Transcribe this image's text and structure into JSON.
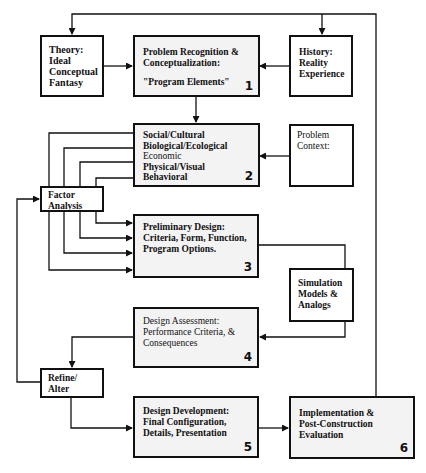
{
  "diagram": {
    "type": "flowchart",
    "nodes": {
      "theory": {
        "lines": [
          "Theory:",
          "Ideal",
          "Conceptual",
          "Fantasy"
        ]
      },
      "box1": {
        "lines": [
          "Problem Recognition &",
          "Conceptualization:"
        ],
        "sub": "\"Program Elements\"",
        "number": "1"
      },
      "history": {
        "lines": [
          "History:",
          "Reality",
          "Experience"
        ]
      },
      "box2": {
        "lines": [
          "Social/Cultural",
          "Biological/Ecological",
          "Economic",
          "Physical/Visual",
          "Behavioral"
        ],
        "number": "2"
      },
      "context": {
        "lines": [
          "Problem",
          "Context:"
        ]
      },
      "factor": {
        "lines": [
          "Factor",
          "Analysis"
        ]
      },
      "box3": {
        "lines": [
          "Preliminary Design:",
          "Criteria, Form, Function,",
          "Program Options."
        ],
        "number": "3"
      },
      "simulation": {
        "lines": [
          "Simulation",
          "Models &",
          "Analogs"
        ]
      },
      "box4": {
        "lines": [
          "Design Assessment:",
          "Performance Criteria, &",
          "Consequences"
        ],
        "number": "4"
      },
      "refine": {
        "lines": [
          "Refine/",
          "Alter"
        ]
      },
      "box5": {
        "lines": [
          "Design Development:",
          "Final Configuration,",
          "Details, Presentation"
        ],
        "number": "5"
      },
      "box6": {
        "lines": [
          "Implementation &",
          "Post-Construction",
          "Evaluation"
        ],
        "number": "6"
      }
    },
    "edges": [
      [
        "theory",
        "box1"
      ],
      [
        "history",
        "box1"
      ],
      [
        "box1",
        "box2"
      ],
      [
        "context",
        "box2"
      ],
      [
        "box2",
        "factor"
      ],
      [
        "factor",
        "box3"
      ],
      [
        "box3",
        "simulation"
      ],
      [
        "simulation",
        "box4"
      ],
      [
        "box4",
        "refine"
      ],
      [
        "refine",
        "factor"
      ],
      [
        "refine",
        "box5"
      ],
      [
        "box5",
        "box6"
      ],
      [
        "box6",
        "theory"
      ],
      [
        "box6",
        "history"
      ]
    ],
    "colors": {
      "line": "#111111",
      "box_fill": "#ffffff",
      "shaded_fill": "#f3f3f3"
    }
  }
}
